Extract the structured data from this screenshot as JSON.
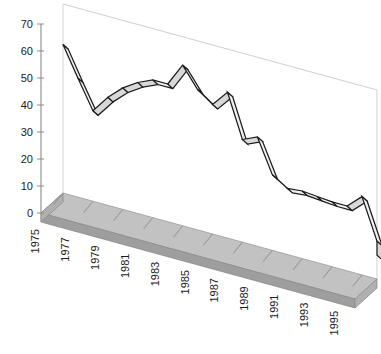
{
  "chart_data": {
    "type": "line",
    "title": "",
    "subtitle": "",
    "xlabel": "",
    "ylabel": "",
    "style": "3d-ribbon-line",
    "grid": false,
    "legend": "none",
    "ylim": [
      0,
      70
    ],
    "yticks": [
      0,
      10,
      20,
      30,
      40,
      50,
      60,
      70
    ],
    "ytick_labels": [
      "0",
      "10",
      "20",
      "30",
      "40",
      "50",
      "60",
      "70"
    ],
    "x": [
      1975,
      1976,
      1977,
      1978,
      1979,
      1980,
      1981,
      1982,
      1983,
      1984,
      1985,
      1986,
      1987,
      1988,
      1989,
      1990,
      1991,
      1992,
      1993,
      1994,
      1995,
      1996
    ],
    "xtick_labels": [
      "1975",
      "1977",
      "1979",
      "1981",
      "1983",
      "1985",
      "1987",
      "1989",
      "1991",
      "1993",
      "1995"
    ],
    "xtick_label_rotation": -90,
    "series": [
      {
        "name": "Series 1",
        "values": [
          55,
          44,
          33.5,
          40,
          45,
          48.5,
          51,
          51,
          59.5,
          52,
          48,
          54,
          38,
          40.5,
          28,
          24.5,
          25,
          24.5,
          24,
          24,
          29,
          14
        ]
      }
    ],
    "colors": {
      "ribbon_top": "#d8d8d8",
      "ribbon_side": "#f0f0f0",
      "ribbon_outline": "#1c1c1c",
      "floor_top": "#c2c2c2",
      "floor_front": "#9a9a9a",
      "wall_line": "#cfcfcf",
      "axis": "#8a8a8a",
      "text": "#1a1a1a"
    }
  },
  "axes": {
    "y_axis_name": "value-axis",
    "x_axis_name": "year-axis"
  }
}
